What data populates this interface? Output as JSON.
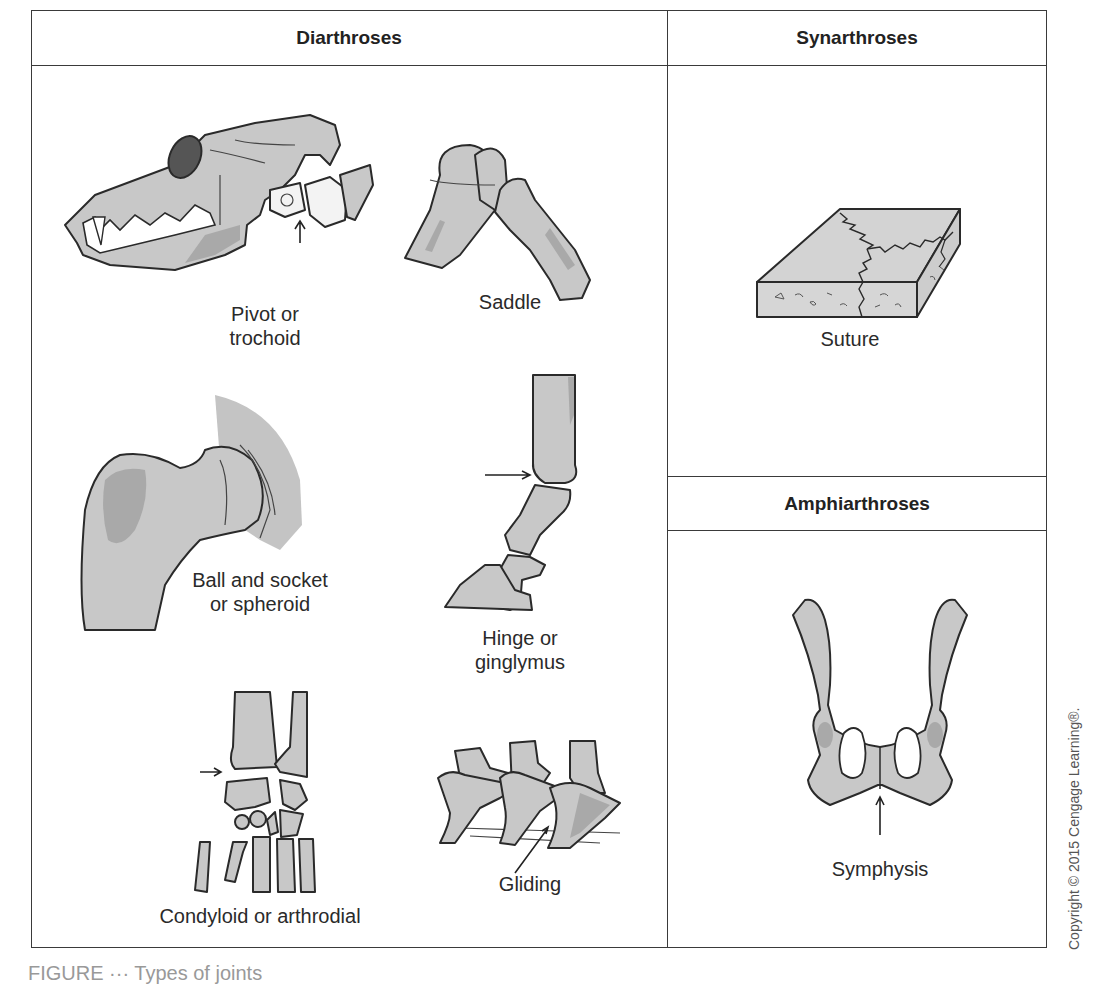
{
  "table": {
    "headers": {
      "diarthroses": "Diarthroses",
      "synarthroses": "Synarthroses",
      "amphiarthroses": "Amphiarthroses"
    }
  },
  "diarthroses": {
    "items": [
      {
        "id": "pivot",
        "label_lines": [
          "Pivot or",
          "trochoid"
        ],
        "illustration": "dog-skull-atlas-axis"
      },
      {
        "id": "saddle",
        "label_lines": [
          "Saddle"
        ],
        "illustration": "carpal-metacarpal-saddle"
      },
      {
        "id": "ball-socket",
        "label_lines": [
          "Ball and socket",
          "or spheroid"
        ],
        "illustration": "femur-head-hip"
      },
      {
        "id": "hinge",
        "label_lines": [
          "Hinge or",
          "ginglymus"
        ],
        "illustration": "equine-digit"
      },
      {
        "id": "condyloid",
        "label_lines": [
          "Condyloid or arthrodial"
        ],
        "illustration": "carpus"
      },
      {
        "id": "gliding",
        "label_lines": [
          "Gliding"
        ],
        "illustration": "vertebrae"
      }
    ]
  },
  "synarthroses": {
    "items": [
      {
        "id": "suture",
        "label_lines": [
          "Suture"
        ],
        "illustration": "skull-suture-slab"
      }
    ]
  },
  "amphiarthroses": {
    "items": [
      {
        "id": "symphysis",
        "label_lines": [
          "Symphysis"
        ],
        "illustration": "pelvis"
      }
    ]
  },
  "copyright": "Copyright © 2015 Cengage Learning®.",
  "caption_partial": "FIGURE ··· Types of joints",
  "colors": {
    "bone_fill": "#c8c8c8",
    "bone_shade": "#a9a9a9",
    "outline": "#2a2a2a",
    "border": "#3a3a3a"
  }
}
